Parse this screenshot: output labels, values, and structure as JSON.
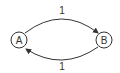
{
  "diagram": {
    "type": "directed-graph",
    "nodes": [
      {
        "id": "A",
        "label": "A"
      },
      {
        "id": "B",
        "label": "B"
      }
    ],
    "edges": [
      {
        "from": "A",
        "to": "B",
        "label": "1"
      },
      {
        "from": "B",
        "to": "A",
        "label": "1"
      }
    ]
  },
  "colors": {
    "stroke": "#333333",
    "background": "#ffffff"
  }
}
